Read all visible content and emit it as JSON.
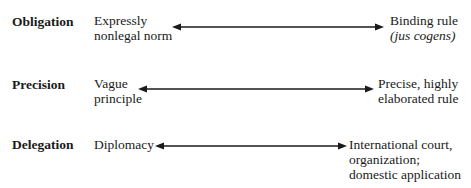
{
  "diagram": {
    "rows": [
      {
        "dimension": "Obligation",
        "low_line1": "Expressly",
        "low_line2": "nonlegal norm",
        "high_line1": "Binding rule",
        "high_line2": "(jus cogens)"
      },
      {
        "dimension": "Precision",
        "low_line1": "Vague",
        "low_line2": "principle",
        "high_line1": "Precise, highly",
        "high_line2": "elaborated rule"
      },
      {
        "dimension": "Delegation",
        "low_line1": "Diplomacy",
        "high_line1": "International court,",
        "high_line2": "organization;",
        "high_line3": "domestic application"
      }
    ],
    "arrow_type": "double-headed"
  }
}
